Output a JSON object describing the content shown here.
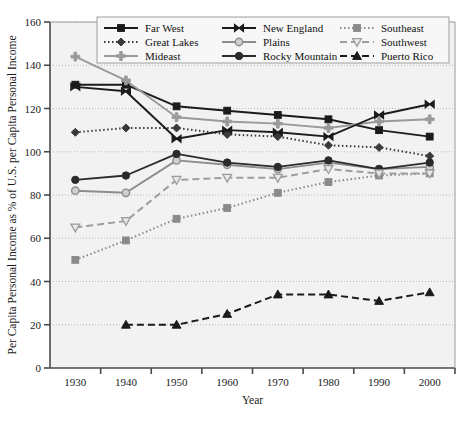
{
  "chart_data": {
    "type": "line",
    "title": "",
    "xlabel": "Year",
    "ylabel": "Per Capita Personal Income as % of U.S. per Capita Personal Income",
    "x": [
      1930,
      1940,
      1950,
      1960,
      1970,
      1980,
      1990,
      2000
    ],
    "xticklabels": [
      "1930",
      "1940",
      "1950",
      "1960",
      "1970",
      "1980",
      "1990",
      "2000"
    ],
    "yticklabels": [
      "0",
      "20",
      "40",
      "60",
      "80",
      "100",
      "120",
      "140",
      "160"
    ],
    "ylim": [
      0,
      160
    ],
    "xlim": [
      1925,
      2005
    ],
    "ytick_step": 20,
    "grid": "horizontal-dotted",
    "legend_position": "top-inside",
    "series": [
      {
        "name": "Far West",
        "values": [
          131,
          131,
          121,
          119,
          117,
          115,
          110,
          107
        ],
        "color": "#1b1b1b",
        "marker": "square",
        "dash": "solid"
      },
      {
        "name": "Great Lakes",
        "values": [
          109,
          111,
          111,
          108,
          107,
          103,
          102,
          98
        ],
        "color": "#3a3a3a",
        "marker": "diamond",
        "dash": "dotted"
      },
      {
        "name": "Mideast",
        "values": [
          144,
          133,
          116,
          114,
          113,
          111,
          114,
          115
        ],
        "color": "#9a9a9a",
        "marker": "plus",
        "dash": "solid"
      },
      {
        "name": "New England",
        "values": [
          130,
          128,
          106,
          110,
          109,
          107,
          117,
          122
        ],
        "color": "#1b1b1b",
        "marker": "bowtie",
        "dash": "solid"
      },
      {
        "name": "Plains",
        "values": [
          82,
          81,
          96,
          94,
          92,
          95,
          92,
          93
        ],
        "color": "#8c8c8c",
        "marker": "circle-open",
        "dash": "solid"
      },
      {
        "name": "Rocky Mountain",
        "values": [
          87,
          89,
          99,
          95,
          93,
          96,
          92,
          95
        ],
        "color": "#2b2b2b",
        "marker": "circle",
        "dash": "solid"
      },
      {
        "name": "Southeast",
        "values": [
          50,
          59,
          69,
          74,
          81,
          86,
          89,
          90
        ],
        "color": "#8a8a8a",
        "marker": "square-gray",
        "dash": "dotted"
      },
      {
        "name": "Southwest",
        "values": [
          65,
          68,
          87,
          88,
          88,
          92,
          90,
          90
        ],
        "color": "#9d9d9d",
        "marker": "triangle-down",
        "dash": "dashed"
      },
      {
        "name": "Puerto Rico",
        "values": [
          null,
          20,
          20,
          25,
          34,
          34,
          31,
          35
        ],
        "color": "#1b1b1b",
        "marker": "triangle-up",
        "dash": "dashed"
      }
    ]
  },
  "legend": {
    "columns": [
      [
        "Far West",
        "Great Lakes",
        "Mideast"
      ],
      [
        "New England",
        "Plains",
        "Rocky Mountain"
      ],
      [
        "Southeast",
        "Southwest",
        "Puerto Rico"
      ]
    ]
  },
  "colors": {
    "plot_background": "#f2f2f2",
    "axis": "#4a4a4a",
    "grid": "#b8b8b8",
    "page_background": "#ffffff"
  }
}
